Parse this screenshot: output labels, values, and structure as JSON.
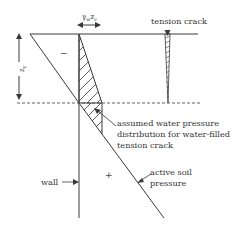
{
  "diagram": {
    "title": "",
    "labels": {
      "tension_crack": "tension crack",
      "water_pressure_line1": "assumed water pressure",
      "water_pressure_line2": "distribution for water-filled",
      "water_pressure_line3": "tension crack",
      "active_soil_line1": "active soil",
      "active_soil_line2": "pressure",
      "wall": "wall",
      "negative_zone": "−",
      "positive_zone": "+",
      "depth_symbol": "z",
      "depth_subscript": "c",
      "water_pressure_symbol": "γ",
      "water_pressure_sub_w": "w",
      "water_pressure_z": "z",
      "water_pressure_sub_c": "c"
    },
    "colors": {
      "line": "#3a3a3a",
      "hatch": "#3a3a3a",
      "text": "#333333",
      "background": "#ffffff"
    }
  }
}
